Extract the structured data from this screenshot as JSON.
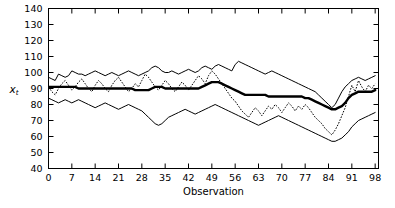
{
  "chart_data": {
    "type": "line",
    "title": "",
    "xlabel": "Observation",
    "ylabel": "x_t",
    "ylabel_base": "x",
    "ylabel_sub": "t",
    "xlim": [
      0,
      99
    ],
    "ylim": [
      40,
      140
    ],
    "grid": false,
    "legend": null,
    "xticks": [
      0,
      7,
      14,
      21,
      28,
      35,
      42,
      49,
      56,
      63,
      70,
      77,
      84,
      91,
      98
    ],
    "xtick_labels": [
      "0",
      "7",
      "14",
      "21",
      "28",
      "35",
      "42",
      "49",
      "56",
      "63",
      "70",
      "77",
      "84",
      "91",
      "98"
    ],
    "yticks": [
      40,
      50,
      60,
      70,
      80,
      90,
      100,
      110,
      120,
      130,
      140
    ],
    "ytick_labels": [
      "40",
      "50",
      "60",
      "70",
      "80",
      "90",
      "100",
      "110",
      "120",
      "130",
      "140"
    ],
    "x": [
      0,
      1,
      2,
      3,
      4,
      5,
      6,
      7,
      8,
      9,
      10,
      11,
      12,
      13,
      14,
      15,
      16,
      17,
      18,
      19,
      20,
      21,
      22,
      23,
      24,
      25,
      26,
      27,
      28,
      29,
      30,
      31,
      32,
      33,
      34,
      35,
      36,
      37,
      38,
      39,
      40,
      41,
      42,
      43,
      44,
      45,
      46,
      47,
      48,
      49,
      50,
      51,
      52,
      53,
      54,
      55,
      56,
      57,
      58,
      59,
      60,
      61,
      62,
      63,
      64,
      65,
      66,
      67,
      68,
      69,
      70,
      71,
      72,
      73,
      74,
      75,
      76,
      77,
      78,
      79,
      80,
      81,
      82,
      83,
      84,
      85,
      86,
      87,
      88,
      89,
      90,
      91,
      92,
      93,
      94,
      95,
      96,
      97,
      98
    ],
    "series": [
      {
        "name": "upper-bound",
        "style": "solid-thin",
        "values": [
          97,
          96,
          95,
          99,
          98,
          97,
          98,
          101,
          100,
          99,
          99,
          98,
          99,
          100,
          101,
          100,
          99,
          98,
          99,
          100,
          99,
          98,
          99,
          100,
          101,
          100,
          99,
          98,
          99,
          100,
          101,
          103,
          104,
          103,
          101,
          100,
          100,
          101,
          100,
          99,
          100,
          101,
          102,
          101,
          100,
          101,
          103,
          104,
          103,
          102,
          104,
          105,
          104,
          103,
          102,
          101,
          105,
          107,
          106,
          105,
          104,
          103,
          102,
          101,
          100,
          99,
          100,
          101,
          100,
          99,
          98,
          97,
          96,
          95,
          94,
          93,
          92,
          91,
          90,
          89,
          88,
          86,
          84,
          82,
          80,
          78,
          80,
          84,
          88,
          91,
          93,
          95,
          96,
          97,
          96,
          95,
          96,
          97,
          98
        ]
      },
      {
        "name": "center-forecast",
        "style": "solid-thick",
        "values": [
          91,
          91,
          91,
          91,
          91,
          91,
          91,
          91,
          91,
          90,
          90,
          90,
          90,
          90,
          90,
          90,
          90,
          90,
          90,
          90,
          90,
          90,
          90,
          90,
          90,
          90,
          89,
          89,
          89,
          89,
          89,
          90,
          91,
          91,
          91,
          90,
          90,
          90,
          90,
          90,
          90,
          90,
          90,
          90,
          90,
          90,
          91,
          92,
          93,
          94,
          94,
          94,
          93,
          92,
          91,
          90,
          89,
          88,
          87,
          86,
          86,
          86,
          86,
          86,
          86,
          86,
          85,
          85,
          85,
          85,
          85,
          85,
          85,
          85,
          85,
          85,
          85,
          84,
          84,
          83,
          82,
          81,
          80,
          79,
          78,
          77,
          77,
          78,
          79,
          81,
          84,
          86,
          87,
          88,
          88,
          88,
          88,
          88,
          89
        ]
      },
      {
        "name": "lower-bound",
        "style": "solid-thin",
        "values": [
          84,
          83,
          82,
          81,
          82,
          83,
          82,
          81,
          82,
          83,
          82,
          81,
          80,
          79,
          78,
          79,
          80,
          81,
          80,
          79,
          78,
          77,
          78,
          79,
          80,
          79,
          78,
          77,
          76,
          74,
          72,
          70,
          68,
          67,
          68,
          70,
          72,
          73,
          74,
          75,
          76,
          77,
          76,
          75,
          74,
          75,
          76,
          77,
          78,
          79,
          80,
          79,
          78,
          77,
          76,
          75,
          74,
          73,
          72,
          71,
          70,
          69,
          68,
          67,
          68,
          69,
          70,
          71,
          72,
          73,
          72,
          71,
          70,
          69,
          68,
          67,
          66,
          65,
          64,
          63,
          62,
          61,
          60,
          59,
          58,
          57,
          57,
          58,
          59,
          61,
          63,
          66,
          68,
          70,
          71,
          72,
          73,
          74,
          75
        ]
      },
      {
        "name": "observed",
        "style": "dotted",
        "values": [
          91,
          88,
          86,
          90,
          93,
          95,
          92,
          89,
          91,
          94,
          96,
          93,
          90,
          88,
          92,
          95,
          93,
          90,
          88,
          92,
          95,
          97,
          94,
          91,
          88,
          90,
          93,
          91,
          95,
          99,
          97,
          94,
          91,
          89,
          92,
          95,
          93,
          90,
          88,
          91,
          94,
          92,
          89,
          92,
          95,
          98,
          96,
          93,
          98,
          101,
          99,
          96,
          93,
          90,
          87,
          84,
          82,
          79,
          76,
          74,
          72,
          75,
          78,
          76,
          73,
          76,
          79,
          77,
          80,
          78,
          75,
          78,
          81,
          79,
          76,
          79,
          77,
          80,
          78,
          75,
          72,
          70,
          68,
          65,
          63,
          61,
          64,
          68,
          73,
          78,
          85,
          92,
          88,
          95,
          91,
          88,
          92,
          90,
          93
        ]
      }
    ]
  }
}
